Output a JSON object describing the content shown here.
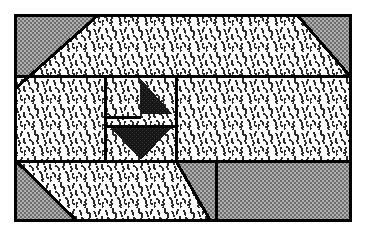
{
  "figure": {
    "kind": "technical-line-drawing",
    "title": "Sectional view diagram",
    "width": 365,
    "height": 234,
    "background_color": "#ffffff",
    "line_color": "#000000",
    "border": {
      "name": "outer-frame",
      "x": 14,
      "y": 14,
      "width": 338,
      "height": 208,
      "stroke_width": 3,
      "stroke_color": "#000000",
      "fill": "none"
    },
    "fills": {
      "hatched_white": "#ffffff",
      "stipple_gray": "#9a9a9a",
      "solid_black": "#1a1a1a",
      "line": "#000000"
    },
    "regions": [
      {
        "name": "top-left-gray-corner",
        "fill": "stipple_gray",
        "points": "16,16 97,16 16,88"
      },
      {
        "name": "top-right-gray-corner",
        "fill": "stipple_gray",
        "points": "298,16 350,16 350,76"
      },
      {
        "name": "bottom-left-gray-corner",
        "fill": "stipple_gray",
        "points": "16,161 16,220 76,220"
      },
      {
        "name": "bottom-right-gray-region",
        "fill": "stipple_gray",
        "points": "176,161 350,161 350,220 210,220"
      },
      {
        "name": "upper-hatched-band",
        "fill": "hatched_white",
        "points": "97,16 298,16 350,76 16,76 16,88"
      },
      {
        "name": "middle-hatched-band",
        "fill": "hatched_white",
        "points": "16,78 350,78 350,159 16,159"
      },
      {
        "name": "lower-hatched-band",
        "fill": "hatched_white",
        "points": "16,161 176,161 210,220 76,220"
      }
    ],
    "lines": [
      {
        "name": "upper-band-divider",
        "x1": 16,
        "y1": 76,
        "x2": 350,
        "y2": 76
      },
      {
        "name": "lower-band-divider",
        "x1": 16,
        "y1": 161,
        "x2": 350,
        "y2": 161
      },
      {
        "name": "top-left-diagonal",
        "x1": 97,
        "y1": 16,
        "x2": 16,
        "y2": 88
      },
      {
        "name": "top-right-diagonal",
        "x1": 298,
        "y1": 16,
        "x2": 350,
        "y2": 76
      },
      {
        "name": "bottom-left-diagonal",
        "x1": 16,
        "y1": 161,
        "x2": 76,
        "y2": 220
      },
      {
        "name": "bottom-middle-diagonal",
        "x1": 176,
        "y1": 161,
        "x2": 210,
        "y2": 220
      },
      {
        "name": "bottom-right-vertical",
        "x1": 216,
        "y1": 161,
        "x2": 216,
        "y2": 220
      }
    ],
    "center_box": {
      "name": "central-detail-box",
      "x": 105,
      "y": 76,
      "width": 71,
      "height": 85,
      "stroke_width": 2,
      "inner_divider_y1": 118,
      "inner_divider_y2": 127,
      "inner_divider_x_start": 105,
      "inner_divider_x_end": 176,
      "notch_line": {
        "x1": 105,
        "y1": 118,
        "x2": 140,
        "y2": 118
      }
    },
    "arrows": [
      {
        "name": "upper-right-triangle-arrow",
        "fill": "solid_black",
        "points": "140,78 172,114 140,114"
      },
      {
        "name": "lower-down-arrow",
        "fill": "solid_black",
        "points": "110,127 172,127 141,160"
      }
    ],
    "labels": []
  }
}
